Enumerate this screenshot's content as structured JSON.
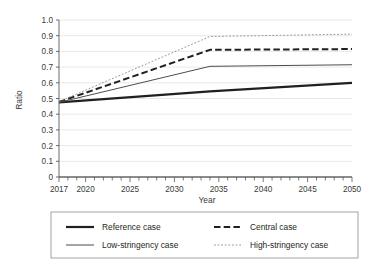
{
  "chart_data": {
    "type": "line",
    "title": "",
    "xlabel": "Year",
    "ylabel": "Ratio",
    "xlim": [
      2017,
      2050
    ],
    "ylim": [
      0,
      1.0
    ],
    "grid": true,
    "legend_position": "bottom",
    "x_ticks": [
      2017,
      2020,
      2025,
      2030,
      2035,
      2040,
      2045,
      2050
    ],
    "x_tick_labels": [
      "2017",
      "2020",
      "2025",
      "2030",
      "2035",
      "2040",
      "2045",
      "2050"
    ],
    "x_minor_tick_interval": 1,
    "y_ticks": [
      0,
      0.1,
      0.2,
      0.3,
      0.4,
      0.5,
      0.6,
      0.7,
      0.8,
      0.9,
      1.0
    ],
    "y_tick_labels": [
      "0",
      "0.1",
      "0.2",
      "0.3",
      "0.4",
      "0.5",
      "0.6",
      "0.7",
      "0.8",
      "0.9",
      "1.0"
    ],
    "series": [
      {
        "name": "Reference case",
        "style": "solid-thick",
        "color": "#231f20",
        "x": [
          2017,
          2034,
          2050
        ],
        "values": [
          0.475,
          0.545,
          0.6
        ]
      },
      {
        "name": "Central case",
        "style": "dashed-thick",
        "color": "#231f20",
        "x": [
          2017,
          2034,
          2050
        ],
        "values": [
          0.478,
          0.81,
          0.815
        ]
      },
      {
        "name": "Low-stringency case",
        "style": "solid-thin",
        "color": "#4d4d4d",
        "x": [
          2017,
          2034,
          2050
        ],
        "values": [
          0.475,
          0.705,
          0.715
        ]
      },
      {
        "name": "High-stringency case",
        "style": "dotted-thin",
        "color": "#8c8c8c",
        "x": [
          2017,
          2034,
          2050
        ],
        "values": [
          0.48,
          0.895,
          0.91
        ]
      }
    ]
  },
  "axes": {
    "y_label": "Ratio",
    "x_label": "Year",
    "y_ticks": [
      "1.0",
      "0.9",
      "0.8",
      "0.7",
      "0.6",
      "0.5",
      "0.4",
      "0.3",
      "0.2",
      "0.1",
      "0"
    ],
    "x_ticks": [
      "2017",
      "2020",
      "2025",
      "2030",
      "2035",
      "2040",
      "2045",
      "2050"
    ]
  },
  "legend": {
    "entries": [
      {
        "label": "Reference case",
        "style": "solid-thick"
      },
      {
        "label": "Central case",
        "style": "dashed-thick"
      },
      {
        "label": "Low-stringency case",
        "style": "solid-thin"
      },
      {
        "label": "High-stringency case",
        "style": "dotted-thin"
      }
    ]
  },
  "colors": {
    "ink": "#231f20",
    "grid": "#d9d9d9",
    "axis": "#595959",
    "mid_gray": "#4d4d4d",
    "light_gray": "#8c8c8c"
  }
}
